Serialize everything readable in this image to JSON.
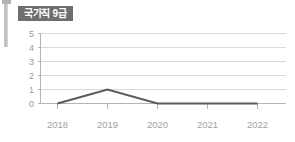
{
  "badge": {
    "label": "국가직 9급"
  },
  "chart_data": {
    "type": "line",
    "title": "국가직 9급",
    "xlabel": "",
    "ylabel": "",
    "categories": [
      "2018",
      "2019",
      "2020",
      "2021",
      "2022"
    ],
    "series": [
      {
        "name": "국가직 9급",
        "values": [
          0,
          1,
          0,
          0,
          0
        ],
        "color": "#5b5b5b"
      }
    ],
    "ylim": [
      0,
      5
    ],
    "yticks": [
      "0",
      "1",
      "2",
      "3",
      "4",
      "5"
    ],
    "grid": true,
    "legend": "none"
  },
  "colors": {
    "badge_bg": "#6e6e6e",
    "badge_text": "#ffffff",
    "gridline": "#d9d9d9",
    "axis": "#b5b5b5",
    "tick_text": "#a2a2a2",
    "series": "#5b5b5b",
    "background": "#ffffff"
  }
}
